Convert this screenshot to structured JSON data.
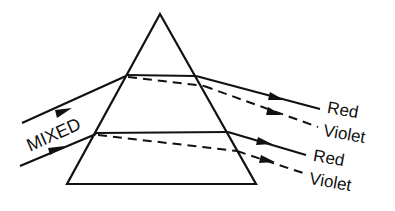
{
  "diagram": {
    "incoming_label": "MIXED",
    "rays": [
      {
        "red_label": "Red",
        "violet_label": "Violet"
      },
      {
        "red_label": "Red",
        "violet_label": "Violet"
      }
    ],
    "colors": {
      "ink": "#111111",
      "background": "#ffffff"
    }
  }
}
